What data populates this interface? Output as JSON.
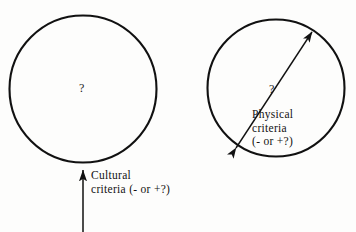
{
  "figure": {
    "background_color": "#fdfdfc",
    "stroke_color": "#111111",
    "width": 356,
    "height": 232
  },
  "left_circle": {
    "name": "cultural-boundary-circle",
    "center_x": 83,
    "center_y": 89,
    "radius": 74,
    "interior_marker": "?",
    "label_lines": [
      "Cultural",
      "criteria (- or +?)"
    ],
    "label_text": "Cultural\ncriteria (- or +?)",
    "arrow": {
      "style": "single-headed",
      "direction": "up",
      "from_x": 83,
      "from_y": 232,
      "to_x": 83,
      "to_y": 168
    }
  },
  "right_circle": {
    "name": "physical-boundary-circle",
    "center_x": 276,
    "center_y": 88,
    "radius": 69,
    "interior_marker": "?",
    "label_lines": [
      "Physical",
      "criteria",
      "(- or +?)"
    ],
    "label_text": "Physical\ncriteria\n(- or +?)",
    "arrow": {
      "style": "double-headed",
      "direction": "diagonal",
      "from_x": 235,
      "from_y": 149,
      "to_x": 313,
      "to_y": 31
    }
  }
}
